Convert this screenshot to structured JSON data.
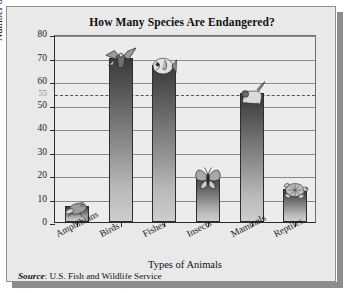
{
  "figure": {
    "title": "How Many Species Are Endangered?",
    "source_label": "Source",
    "source_text": ": U.S. Fish and Wildlife Service",
    "background_color": "#e9e9e9",
    "plot_background_color": "#ececec",
    "bar_color_top": "#3a3a3a",
    "bar_color_bottom": "#cdcdcd",
    "refline_color": "#555555",
    "axis_color": "#2b2b2b"
  },
  "chart_data": {
    "type": "bar",
    "title": "How Many Species Are Endangered?",
    "xlabel": "Types of Animals",
    "ylabel": "Number of Species",
    "categories": [
      "Amphibians",
      "Birds",
      "Fishes",
      "Insects",
      "Mammals",
      "Reptiles"
    ],
    "values": [
      7,
      70,
      67,
      20,
      55,
      14
    ],
    "icons": [
      "frog-icon",
      "eagle-icon",
      "fish-icon",
      "butterfly-icon",
      "panther-icon",
      "turtle-icon"
    ],
    "ylim": [
      0,
      80
    ],
    "yticks": [
      0,
      10,
      20,
      30,
      40,
      50,
      60,
      70,
      80
    ],
    "ytick_labels": [
      "0",
      "10",
      "20",
      "30",
      "40",
      "50",
      "60",
      "70",
      "80"
    ],
    "extra_ytick": {
      "value": 55,
      "label": "55",
      "color": "#8c8c8c"
    },
    "reference_line": {
      "value": 55,
      "style": "dashed",
      "color": "#555555",
      "label": "55"
    },
    "grid": "horizontal",
    "legend": "none"
  }
}
